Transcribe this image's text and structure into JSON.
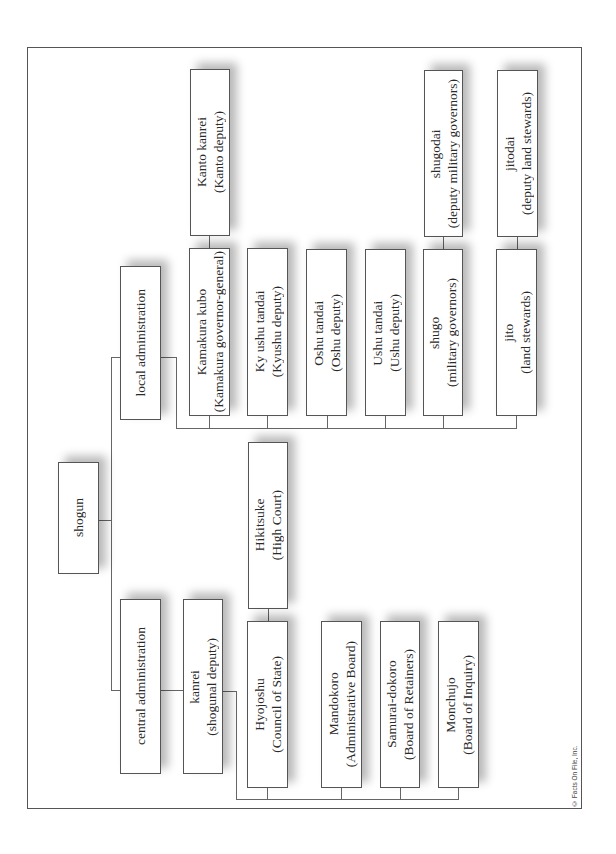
{
  "diagram": {
    "orientation": "rotated-90-ccw",
    "root": {
      "label": "shogun",
      "children": [
        {
          "label": "local administration",
          "children": [
            {
              "label": "Kamakura kubo",
              "sub": "(Kamakura governor-general)",
              "children": [
                {
                  "label": "Kanto kanrei",
                  "sub": "(Kanto deputy)"
                }
              ]
            },
            {
              "label": "Ky ushu tandai",
              "sub": "(Kyushu deputy)"
            },
            {
              "label": "Oshu tandai",
              "sub": "(Oshu deputy)"
            },
            {
              "label": "Ushu tandai",
              "sub": "(Ushu deputy)"
            },
            {
              "label": "shugo",
              "sub": "(military governors)",
              "children": [
                {
                  "label": "shugodai",
                  "sub": "(deputy military governors)"
                }
              ]
            },
            {
              "label": "jito",
              "sub": "(land stewards)",
              "children": [
                {
                  "label": "jitodai",
                  "sub": "(deputy land stewards)"
                }
              ]
            }
          ]
        },
        {
          "label": "central administration",
          "children": [
            {
              "label": "kanrei",
              "sub": "(shogunal deputy)",
              "children": [
                {
                  "label": "Hyojoshu",
                  "sub": "(Council of State)",
                  "children": [
                    {
                      "label": "Hikitsuke",
                      "sub": "(High Court)"
                    }
                  ]
                },
                {
                  "label": "Mandokoro",
                  "sub": "(Administrative Board)"
                },
                {
                  "label": "Samurai-dokoro",
                  "sub": "(Board of Retainers)"
                },
                {
                  "label": "Monchujo",
                  "sub": "(Board of Inquiry)"
                }
              ]
            }
          ]
        }
      ]
    }
  },
  "nodes": {
    "shogun": {
      "l1": "shogun"
    },
    "local_admin": {
      "l1": "local administration"
    },
    "central_admin": {
      "l1": "central administration"
    },
    "kamakura_kubo": {
      "l1": "Kamakura kubo",
      "l2": "(Kamakura governor-general)"
    },
    "kanto_kanrei": {
      "l1": "Kanto kanrei",
      "l2": "(Kanto deputy)"
    },
    "kyushu_tandai": {
      "l1": "Ky ushu tandai",
      "l2": "(Kyushu deputy)"
    },
    "oshu_tandai": {
      "l1": "Oshu tandai",
      "l2": "(Oshu deputy)"
    },
    "ushu_tandai": {
      "l1": "Ushu tandai",
      "l2": "(Ushu deputy)"
    },
    "shugo": {
      "l1": "shugo",
      "l2": "(military governors)"
    },
    "shugodai": {
      "l1": "shugodai",
      "l2": "(deputy military governors)"
    },
    "jito": {
      "l1": "jito",
      "l2": "(land stewards)"
    },
    "jitodai": {
      "l1": "jitodai",
      "l2": "(deputy land stewards)"
    },
    "kanrei": {
      "l1": "kanrei",
      "l2": "(shogunal deputy)"
    },
    "hikitsuke": {
      "l1": "Hikitsuke",
      "l2": "(High Court)"
    },
    "hyojoshu": {
      "l1": "Hyojoshu",
      "l2": "(Council of State)"
    },
    "mandokoro": {
      "l1": "Mandokoro",
      "l2": "(Administrative Board)"
    },
    "samurai_dokoro": {
      "l1": "Samurai-dokoro",
      "l2": "(Board of Retainers)"
    },
    "monchujo": {
      "l1": "Monchujo",
      "l2": "(Board of Inquiry)"
    }
  },
  "credit": "© Facts On File, Inc."
}
